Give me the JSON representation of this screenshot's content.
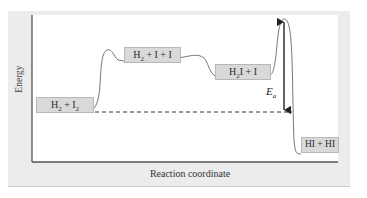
{
  "diagram": {
    "type": "energy-profile",
    "y_axis_label": "Energy",
    "x_axis_label": "Reaction coordinate",
    "species": [
      {
        "id": "reactants",
        "base": "H",
        "sub1": "2",
        "mid": " + I",
        "sub2": "2",
        "tail": ""
      },
      {
        "id": "intermediate-1",
        "base": "H",
        "sub1": "2",
        "mid": " + I + I",
        "sub2": "",
        "tail": ""
      },
      {
        "id": "intermediate-2",
        "base": "H",
        "sub1": "2",
        "mid": "I + I",
        "sub2": "",
        "tail": ""
      },
      {
        "id": "products",
        "base": "HI + HI",
        "sub1": "",
        "mid": "",
        "sub2": "",
        "tail": ""
      }
    ],
    "activation_energy": {
      "symbol": "E",
      "subscript": "a",
      "from": "reactants energy level (dashed line)",
      "to": "highest transition state peak"
    },
    "colors": {
      "panel_background": "#ececec",
      "plot_background": "#ffffff",
      "label_box": "#d9d9d9",
      "curve": "#777777",
      "axis": "#555555"
    }
  }
}
